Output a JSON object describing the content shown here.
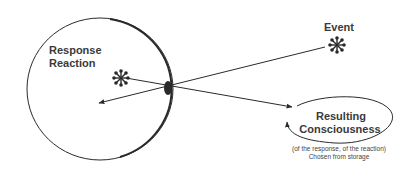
{
  "diagram": {
    "circle_label": {
      "line1": "Response",
      "line2": "Reaction"
    },
    "event_label": "Event",
    "ellipse_label": {
      "line1": "Resulting",
      "line2": "Consciousness"
    },
    "caption": {
      "line1": "(of the response, of the reaction)",
      "line2": "Chosen from storage"
    },
    "colors": {
      "stroke": "#2a2a2a",
      "text": "#3a3a3a",
      "background": "#ffffff"
    }
  }
}
